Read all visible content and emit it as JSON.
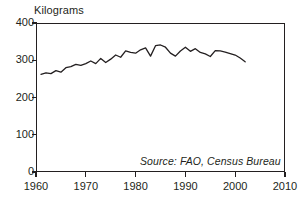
{
  "chart_data": {
    "type": "line",
    "title": "",
    "ylabel": "Kilograms",
    "xlabel": "",
    "ylim": [
      0,
      400
    ],
    "xlim": [
      1960,
      2010
    ],
    "yticks": [
      0,
      100,
      200,
      300,
      400
    ],
    "xticks": [
      1960,
      1970,
      1980,
      1990,
      2000,
      2010
    ],
    "ytick_labels": [
      "0",
      "100",
      "200",
      "300",
      "400"
    ],
    "xtick_labels": [
      "1960",
      "1970",
      "1980",
      "1990",
      "2000",
      "2010"
    ],
    "grid": false,
    "legend": null,
    "annotations": [
      "Source: FAO, Census Bureau"
    ],
    "series": [
      {
        "name": "Grain production per person",
        "color": "#231f20",
        "x": [
          1961,
          1962,
          1963,
          1964,
          1965,
          1966,
          1967,
          1968,
          1969,
          1970,
          1971,
          1972,
          1973,
          1974,
          1975,
          1976,
          1977,
          1978,
          1979,
          1980,
          1981,
          1982,
          1983,
          1984,
          1985,
          1986,
          1987,
          1988,
          1989,
          1990,
          1991,
          1992,
          1993,
          1994,
          1995,
          1996,
          1997,
          1998,
          1999,
          2000,
          2001,
          2002
        ],
        "values": [
          262,
          266,
          264,
          272,
          268,
          280,
          283,
          289,
          286,
          291,
          298,
          291,
          305,
          294,
          303,
          314,
          308,
          325,
          321,
          319,
          328,
          333,
          311,
          339,
          341,
          335,
          319,
          311,
          325,
          335,
          324,
          331,
          321,
          317,
          310,
          326,
          325,
          322,
          318,
          314,
          306,
          296
        ]
      }
    ]
  },
  "axis_title": "Kilograms",
  "source_note": "Source: FAO, Census Bureau",
  "plot": {
    "left_px": 36,
    "top_px": 23,
    "width_px": 249,
    "height_px": 149
  }
}
